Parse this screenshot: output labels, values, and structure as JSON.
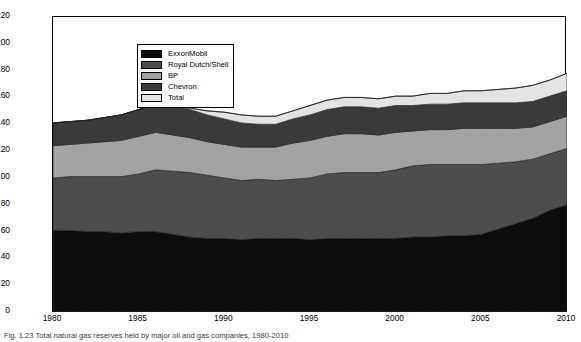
{
  "figure": {
    "caption": "Fig. 1.23 Total natural gas reserves held by major oil and gas companies, 1980-2010"
  },
  "axes": {
    "ylabel": "Billions of cubic feet",
    "xlabel": "",
    "yticks": [
      0,
      20,
      40,
      60,
      80,
      100,
      120,
      140,
      160,
      180,
      200,
      220
    ],
    "xticks": [
      1980,
      1985,
      1990,
      1995,
      2000,
      2005,
      2010
    ],
    "ylim": [
      0,
      220
    ],
    "xlim": [
      1980,
      2010
    ],
    "grid": false
  },
  "legend": {
    "position": "upper-left-inside",
    "items": [
      {
        "label": "ExxonMobil",
        "color": "#0d0d0d"
      },
      {
        "label": "Royal Dutch/Shell",
        "color": "#4d4d4d"
      },
      {
        "label": "BP",
        "color": "#a3a3a3"
      },
      {
        "label": "Chevron",
        "color": "#3a3a3a"
      },
      {
        "label": "Total",
        "color": "#e3e3e3"
      }
    ]
  },
  "colors": {
    "exxonmobil": "#0d0d0d",
    "royal_dutch_shell": "#4d4d4d",
    "bp": "#a3a3a3",
    "chevron": "#3a3a3a",
    "total": "#e3e3e3",
    "background": "#ffffff",
    "axis": "#000000",
    "outline": "#2a2a2a"
  },
  "chart_data": {
    "type": "area",
    "stacked": true,
    "title": "",
    "xlabel": "",
    "ylabel": "Billions of cubic feet",
    "xlim": [
      1980,
      2010
    ],
    "ylim": [
      0,
      220
    ],
    "grid": false,
    "legend_position": "upper-left-inside",
    "x": [
      1980,
      1981,
      1982,
      1983,
      1984,
      1985,
      1986,
      1987,
      1988,
      1989,
      1990,
      1991,
      1992,
      1993,
      1994,
      1995,
      1996,
      1997,
      1998,
      1999,
      2000,
      2001,
      2002,
      2003,
      2004,
      2005,
      2006,
      2007,
      2008,
      2009,
      2010
    ],
    "series": [
      {
        "name": "ExxonMobil",
        "color": "#0d0d0d",
        "values": [
          61,
          61,
          60,
          60,
          59,
          60,
          60,
          58,
          56,
          55,
          55,
          54,
          55,
          55,
          55,
          54,
          55,
          55,
          55,
          55,
          55,
          56,
          56,
          57,
          57,
          58,
          62,
          66,
          70,
          76,
          80
        ]
      },
      {
        "name": "Royal Dutch/Shell",
        "color": "#4d4d4d",
        "values": [
          39,
          40,
          41,
          41,
          42,
          43,
          46,
          47,
          48,
          47,
          45,
          44,
          44,
          43,
          44,
          46,
          48,
          49,
          49,
          49,
          51,
          53,
          54,
          53,
          53,
          52,
          49,
          46,
          44,
          42,
          42
        ]
      },
      {
        "name": "BP",
        "color": "#a3a3a3",
        "values": [
          24,
          24,
          25,
          26,
          27,
          28,
          28,
          27,
          26,
          25,
          25,
          25,
          24,
          25,
          27,
          28,
          28,
          29,
          29,
          28,
          28,
          26,
          26,
          26,
          27,
          27,
          26,
          25,
          24,
          24,
          24
        ]
      },
      {
        "name": "Chevron",
        "color": "#3a3a3a",
        "values": [
          17,
          17,
          17,
          18,
          19,
          20,
          21,
          22,
          21,
          20,
          19,
          18,
          17,
          17,
          18,
          19,
          20,
          20,
          20,
          20,
          20,
          19,
          19,
          19,
          19,
          19,
          19,
          19,
          19,
          19,
          19
        ]
      },
      {
        "name": "Total",
        "color": "#e3e3e3",
        "values": [
          0,
          0,
          0,
          0,
          0,
          0,
          0,
          0,
          1,
          3,
          5,
          6,
          6,
          6,
          6,
          7,
          7,
          7,
          7,
          7,
          7,
          7,
          8,
          8,
          9,
          9,
          10,
          11,
          12,
          12,
          13
        ]
      }
    ],
    "totals": [
      141,
      142,
      143,
      145,
      147,
      151,
      155,
      154,
      152,
      150,
      149,
      147,
      146,
      146,
      150,
      154,
      158,
      160,
      160,
      159,
      161,
      161,
      163,
      163,
      165,
      165,
      166,
      167,
      169,
      173,
      178
    ]
  }
}
